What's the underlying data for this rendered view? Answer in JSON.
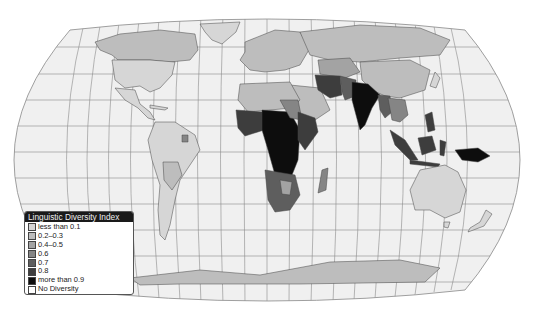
{
  "map": {
    "title": "Linguistic Diversity Index",
    "projection": "Robinson",
    "background": "#ffffff",
    "ocean_color": "#f0f0f0",
    "graticule_color": "#8a8a8a"
  },
  "legend": {
    "title": "Linguistic Diversity Index",
    "items": [
      {
        "label": "less than 0.1",
        "color": "#d6d6d6"
      },
      {
        "label": "0.2–0.3",
        "color": "#bdbdbd"
      },
      {
        "label": "0.4–0.5",
        "color": "#a3a3a3"
      },
      {
        "label": "0.6",
        "color": "#858585"
      },
      {
        "label": "0.7",
        "color": "#5e5e5e"
      },
      {
        "label": "0.8",
        "color": "#3d3d3d"
      },
      {
        "label": "more than 0.9",
        "color": "#0d0d0d"
      },
      {
        "label": "No Diversity",
        "color": "#ffffff"
      }
    ]
  },
  "regions": [
    {
      "name": "Canada",
      "class": "0.2–0.3"
    },
    {
      "name": "United States",
      "class": "less than 0.1"
    },
    {
      "name": "Greenland",
      "class": "less than 0.1"
    },
    {
      "name": "Mexico",
      "class": "less than 0.1"
    },
    {
      "name": "South America",
      "class": "less than 0.1"
    },
    {
      "name": "Bolivia / Paraguay",
      "class": "0.2–0.3"
    },
    {
      "name": "Europe",
      "class": "0.2–0.3"
    },
    {
      "name": "Russia",
      "class": "0.2–0.3"
    },
    {
      "name": "Central Asia",
      "class": "0.4–0.5"
    },
    {
      "name": "China",
      "class": "0.2–0.3"
    },
    {
      "name": "Iran",
      "class": "0.8"
    },
    {
      "name": "Pakistan / Afghanistan",
      "class": "0.7"
    },
    {
      "name": "India",
      "class": "more than 0.9"
    },
    {
      "name": "Southeast Asia",
      "class": "0.6"
    },
    {
      "name": "North Africa",
      "class": "0.2–0.3"
    },
    {
      "name": "Arabian Peninsula",
      "class": "0.2–0.3"
    },
    {
      "name": "West Africa",
      "class": "0.8"
    },
    {
      "name": "Central Africa",
      "class": "more than 0.9"
    },
    {
      "name": "East Africa",
      "class": "0.8"
    },
    {
      "name": "Southern Africa",
      "class": "0.7"
    },
    {
      "name": "Madagascar",
      "class": "0.6"
    },
    {
      "name": "Indonesia",
      "class": "0.8"
    },
    {
      "name": "Papua New Guinea",
      "class": "more than 0.9"
    },
    {
      "name": "Australia",
      "class": "less than 0.1"
    },
    {
      "name": "New Zealand",
      "class": "less than 0.1"
    },
    {
      "name": "Antarctica",
      "class": "0.2–0.3"
    }
  ]
}
